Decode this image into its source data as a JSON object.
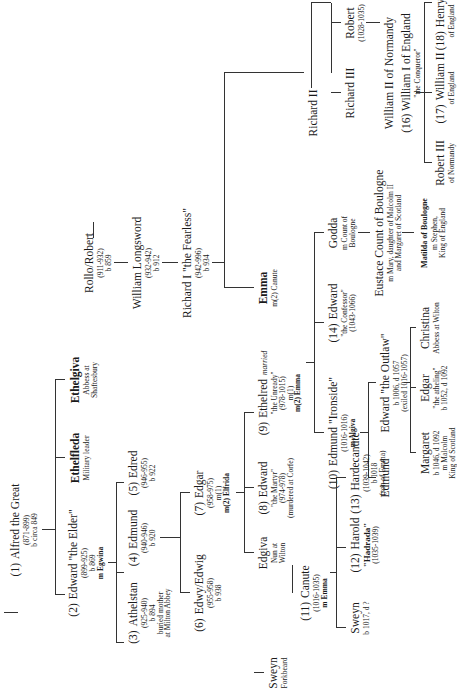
{
  "diagram": {
    "type": "family-tree",
    "orientation": "rotated-90-ccw",
    "line_color": "#333333",
    "nodes": {
      "alfred": {
        "num": "(1)",
        "name": "Alfred the Great",
        "l1": "(871-899)",
        "l2": "b circa 849"
      },
      "edward_elder": {
        "num": "(2)",
        "name": "Edward \"the Elder\"",
        "l1": "(899-925)",
        "l2": "b 869",
        "l3": "m Egwina"
      },
      "ethelfleda": {
        "name": "Ethelfleda",
        "l1": "Military leader"
      },
      "ethelgiva": {
        "name": "Ethelgiva",
        "l1": "Abbess at",
        "l2": "Shaftesbury"
      },
      "athelstan": {
        "num": "(3)",
        "name": "Athelstan",
        "l1": "(925-940)",
        "l2": "b 894",
        "l3": "buried mother",
        "l4": "at Milton Abbey"
      },
      "edmund1": {
        "num": "(4)",
        "name": "Edmund",
        "l1": "(940-946)",
        "l2": "b 920"
      },
      "edred": {
        "num": "(5)",
        "name": "Edred",
        "l1": "(946-955)",
        "l2": "b 922"
      },
      "edwy": {
        "num": "(6)",
        "name": "Edwy/Edwig",
        "l1": "(955-958)",
        "l2": "b 938"
      },
      "edgar": {
        "num": "(7)",
        "name": "Edgar",
        "l1": "(958-975)",
        "l2": "m(1)",
        "l3": "m(2) Elfrida"
      },
      "edgiva": {
        "name": "Edgiva",
        "l1": "Nun at",
        "l2": "Wilton"
      },
      "edward_martyr": {
        "num": "(8)",
        "name": "Edward",
        "l1": "\"the Martyr\"",
        "l2": "(974-978)",
        "l3": "(murdered at Corfe)"
      },
      "ethelred": {
        "num": "(9)",
        "name": "Ethelred",
        "married": "married",
        "l1": "\"the Unready\"",
        "l2": "(978-1015)",
        "l3": "m(1)",
        "l4": "m(2) Emma"
      },
      "emma": {
        "name": "Emma",
        "l1": "m(2) Canute"
      },
      "rollo": {
        "name": "Rollo/Robert",
        "l1": "(911-932)",
        "l2": "b 859"
      },
      "william_longsword": {
        "name": "William Longsword",
        "l1": "(932-942)",
        "l2": "b 912"
      },
      "richard1": {
        "name": "Richard I \"the Fearless\"",
        "l1": "(942-996)",
        "l2": "b 934"
      },
      "richard2": {
        "name": "Richard II"
      },
      "richard3": {
        "name": "Richard III"
      },
      "robert": {
        "name": "Robert",
        "l1": "(1028-1035)"
      },
      "william_conq": {
        "name": "William II of Normandy",
        "name2": "(16) William I  of England",
        "l1": "\"the Conqueror\""
      },
      "robert3": {
        "name": "Robert III",
        "l1": "of Normandy"
      },
      "william2": {
        "num": "(17)",
        "name": "William II",
        "l1": "of England"
      },
      "henry1": {
        "num": "(18)",
        "name": "Henry I",
        "l1": "of England"
      },
      "edmund_ironside": {
        "num": "(10)",
        "name": "Edmund \"Ironside\"",
        "l1": "(1016-1016)",
        "l2": "m Algiva"
      },
      "edward_confessor": {
        "num": "(14)",
        "name": "Edward",
        "l1": "\"the Confessor\"",
        "l2": "(1043-1066)"
      },
      "godda": {
        "name": "Godda",
        "l1": "m Count of",
        "l2": "Boulogne"
      },
      "eustace": {
        "name": "Eustace Count of Boulogne",
        "l1": "m Mary, daughter of Malcolm II",
        "l2": "and Margaret of Scotland"
      },
      "matilda": {
        "name": "Matilda of Boulogne",
        "l1": "m Stephen,",
        "l2": "King of England"
      },
      "edmund2": {
        "name": "Edmund"
      },
      "edward_outlaw": {
        "name": "Edward \"the Outlaw\"",
        "l1": "b 1006, d 1057",
        "l2": "(exiled 1016-1057)"
      },
      "margaret": {
        "name": "Margaret",
        "l1": "b 1046, d 1092",
        "l2": "m Malcolm",
        "l3": "King of Scotland"
      },
      "edgar_atheling": {
        "name": "Edgar",
        "l1": "\"the atheling\"",
        "l2": "b 1052, d 1092"
      },
      "christina": {
        "name": "Christina",
        "l1": "Abbess at Wilton"
      },
      "sweyn_forkbeard": {
        "name": "Sweyn",
        "l1": "Forkbeard"
      },
      "canute": {
        "num": "(11)",
        "name": "Canute",
        "l1": "(1016-1035)",
        "l2": "m Emma"
      },
      "sweyn2": {
        "name": "Sweyn",
        "l1": "b 1017, d ?"
      },
      "harold": {
        "num": "(12)",
        "name": "Harold",
        "l1": "\"Hadrada\"",
        "l2": "(1035-1039)"
      },
      "hardecanute": {
        "num": "(13)",
        "name": "Hardecanute",
        "l1": "(1039-1042)",
        "l2": "b 1018",
        "l3": "(son of Emma)"
      }
    }
  }
}
